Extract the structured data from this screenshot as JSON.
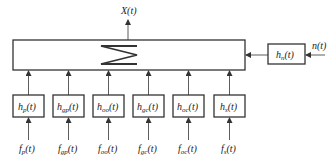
{
  "diagram": {
    "output": {
      "name": "X",
      "arg": "(t)"
    },
    "summer": {
      "symbol": "sum"
    },
    "noise": {
      "block": {
        "name": "h",
        "sub": "n",
        "arg": "(t)"
      },
      "input": {
        "name": "n",
        "arg": "(t)"
      }
    },
    "channels": [
      {
        "block": {
          "name": "h",
          "sub": "p",
          "arg": "(t)"
        },
        "input": {
          "name": "f",
          "sub": "p",
          "arg": "(t)"
        }
      },
      {
        "block": {
          "name": "h",
          "sub": "gp",
          "arg": "(t)"
        },
        "input": {
          "name": "f",
          "sub": "gp",
          "arg": "(t)"
        }
      },
      {
        "block": {
          "name": "h",
          "sub": "oo",
          "arg": "(t)"
        },
        "input": {
          "name": "f",
          "sub": "oo",
          "arg": "(t)"
        }
      },
      {
        "block": {
          "name": "h",
          "sub": "gc",
          "arg": "(t)"
        },
        "input": {
          "name": "f",
          "sub": "gc",
          "arg": "(t)"
        }
      },
      {
        "block": {
          "name": "h",
          "sub": "oc",
          "arg": "(t)"
        },
        "input": {
          "name": "f",
          "sub": "oc",
          "arg": "(t)"
        }
      },
      {
        "block": {
          "name": "h",
          "sub": "s",
          "arg": "(t)"
        },
        "input": {
          "name": "f",
          "sub": "s",
          "arg": "(t)"
        }
      }
    ],
    "colors": {
      "line": "#333333",
      "background": "#ffffff"
    }
  }
}
